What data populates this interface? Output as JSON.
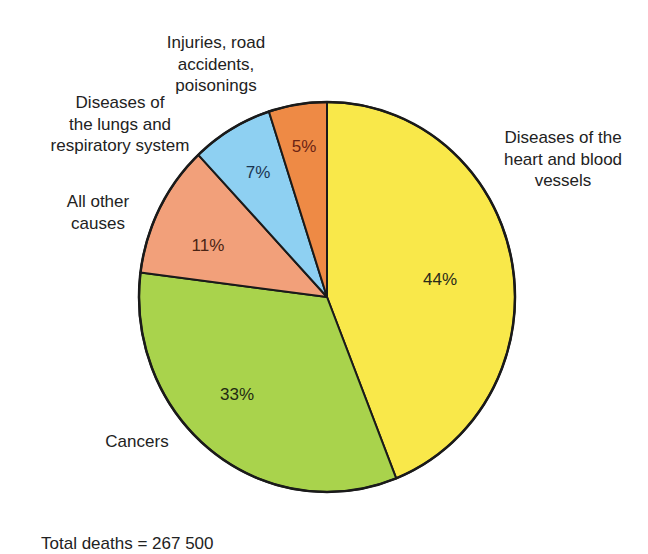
{
  "chart_data": {
    "type": "pie",
    "title": "",
    "start_angle_deg": 0,
    "direction": "clockwise",
    "slices": [
      {
        "label_lines": [
          "Diseases of the",
          "heart and blood",
          "vessels"
        ],
        "label": "Diseases of the heart and blood vessels",
        "value": 44,
        "value_label": "44%",
        "color": "#F9E84A",
        "text_color": "#2a2a1a"
      },
      {
        "label_lines": [
          "Cancers"
        ],
        "label": "Cancers",
        "value": 33,
        "value_label": "33%",
        "color": "#A9D34C",
        "text_color": "#1f2a12"
      },
      {
        "label_lines": [
          "All other",
          "causes"
        ],
        "label": "All other causes",
        "value": 11,
        "value_label": "11%",
        "color": "#F2A07A",
        "text_color": "#4a2414"
      },
      {
        "label_lines": [
          "Diseases of",
          "the lungs and",
          "respiratory system"
        ],
        "label": "Diseases of the lungs and respiratory system",
        "value": 7,
        "value_label": "7%",
        "color": "#8ED0F2",
        "text_color": "#1b3550"
      },
      {
        "label_lines": [
          "Injuries, road",
          "accidents,",
          "poisonings"
        ],
        "label": "Injuries, road accidents, poisonings",
        "value": 5,
        "value_label": "5%",
        "color": "#EE8A45",
        "text_color": "#6b2414"
      }
    ],
    "footnote": "Total deaths = 267 500"
  }
}
